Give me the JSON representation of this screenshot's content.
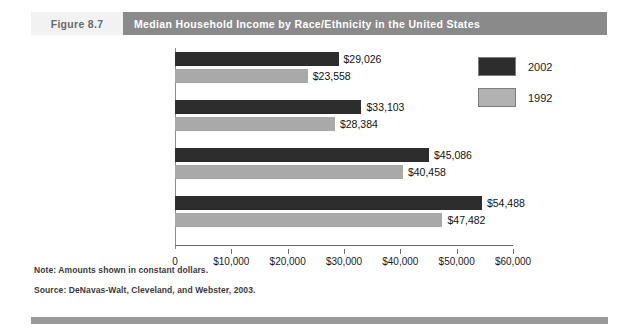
{
  "header": {
    "figure_number": "Figure 8.7",
    "title": "Median Household Income by Race/Ethnicity in the United States"
  },
  "footnotes": {
    "note": "Note: Amounts shown in constant dollars.",
    "source": "Source: DeNavas-Walt, Cleveland, and Webster, 2003."
  },
  "legend": {
    "items": [
      {
        "label": "2002",
        "color": "#2d2d2d"
      },
      {
        "label": "1992",
        "color": "#b2b2b2"
      }
    ]
  },
  "chart_data": {
    "type": "bar",
    "orientation": "horizontal",
    "title": "Median Household Income by Race/Ethnicity in the United States",
    "xlabel": "",
    "ylabel": "",
    "xlim": [
      0,
      60000
    ],
    "xticks": [
      0,
      10000,
      20000,
      30000,
      40000,
      50000,
      60000
    ],
    "xtick_labels": [
      "0",
      "$10,000",
      "$20,000",
      "$30,000",
      "$40,000",
      "$50,000",
      "$60,000"
    ],
    "grid": false,
    "legend_position": "top-right",
    "categories": [
      "African American",
      "Hispanic",
      "White",
      "Asian and Pacific Islander"
    ],
    "category_lines": [
      [
        "African",
        "American"
      ],
      [
        "Hispanic"
      ],
      [
        "White"
      ],
      [
        "Asian and",
        "Pacific Islander"
      ]
    ],
    "series": [
      {
        "name": "2002",
        "color": "#2d2d2d",
        "values": [
          29026,
          33103,
          45086,
          54488
        ],
        "labels": [
          "$29,026",
          "$33,103",
          "$45,086",
          "$54,488"
        ]
      },
      {
        "name": "1992",
        "color": "#a9a9a9",
        "values": [
          23558,
          28384,
          40458,
          47482
        ],
        "labels": [
          "$23,558",
          "$28,384",
          "$40,458",
          "$47,482"
        ]
      }
    ],
    "note": "Note: Amounts shown in constant dollars.",
    "source": "Source: DeNavas-Walt, Cleveland, and Webster, 2003."
  }
}
